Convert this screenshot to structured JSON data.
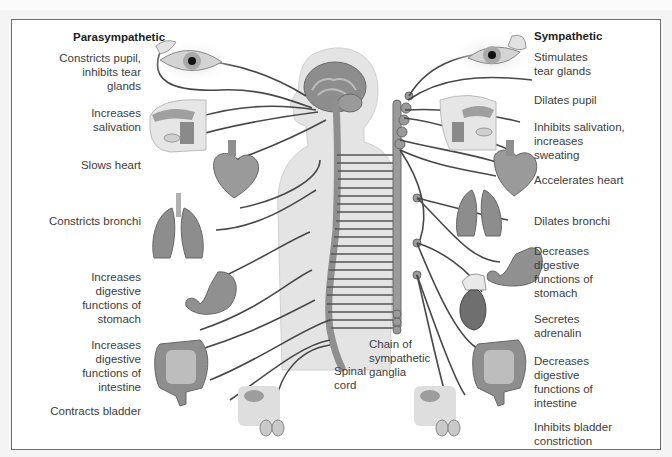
{
  "diagram": {
    "type": "autonomic nervous system",
    "left_header": "Parasympathetic",
    "right_header": "Sympathetic",
    "parasympathetic": [
      {
        "organ": "eye",
        "label": "Constricts pupil,\ninhibits tear\nglands"
      },
      {
        "organ": "salivary-glands",
        "label": "Increases\nsalivation"
      },
      {
        "organ": "heart",
        "label": "Slows heart"
      },
      {
        "organ": "lungs",
        "label": "Constricts bronchi"
      },
      {
        "organ": "stomach",
        "label": "Increases\ndigestive\nfunctions of\nstomach"
      },
      {
        "organ": "intestine",
        "label": "Increases\ndigestive\nfunctions of\nintestine"
      },
      {
        "organ": "bladder",
        "label": "Contracts bladder"
      }
    ],
    "sympathetic": [
      {
        "organ": "tear-glands",
        "label": "Stimulates\ntear glands"
      },
      {
        "organ": "eye",
        "label": "Dilates pupil"
      },
      {
        "organ": "salivary-glands",
        "label": "Inhibits salivation,\nincreases\nsweating"
      },
      {
        "organ": "heart",
        "label": "Accelerates heart"
      },
      {
        "organ": "lungs",
        "label": "Dilates bronchi"
      },
      {
        "organ": "stomach",
        "label": "Decreases\ndigestive\nfunctions of\nstomach"
      },
      {
        "organ": "adrenal-gland",
        "label": "Secretes\nadrenalin"
      },
      {
        "organ": "intestine",
        "label": "Decreases\ndigestive\nfunctions of\nintestine"
      },
      {
        "organ": "bladder",
        "label": "Inhibits bladder\nconstriction"
      }
    ],
    "center_labels": {
      "spinal_cord": "Spinal\ncord",
      "chain_ganglia": "Chain of\nsympathetic\nganglia"
    }
  },
  "colors": {
    "frame_border": "#6e6e6e",
    "nerve": "#4a4a4a",
    "organ_fill": "#8c8c8c",
    "body_fill": "#e3e3e3",
    "text": "#3c3c3c"
  }
}
